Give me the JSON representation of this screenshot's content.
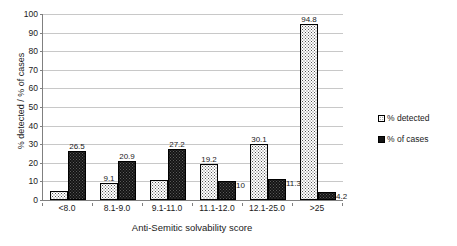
{
  "chart_data": {
    "type": "bar",
    "title": "",
    "subtitle": "",
    "xlabel": "Anti-Semitic solvability score",
    "ylabel": "% detected / % of cases",
    "ylim": [
      0,
      100
    ],
    "ytick_step": 10,
    "yticks": [
      "100",
      "90",
      "80",
      "70",
      "60",
      "50",
      "40",
      "30",
      "20",
      "10",
      "0"
    ],
    "grid": true,
    "legend_position": "right",
    "categories": [
      "<8.0",
      "8.1-9.0",
      "9.1-11.0",
      "11.1-12.0",
      "12.1-25.0",
      ">25"
    ],
    "series": [
      {
        "name": "% detected",
        "values": [
          4.8,
          9.1,
          10.5,
          19.2,
          30.1,
          94.8
        ],
        "labels": [
          "4.8",
          "9.1",
          "10.5",
          "19.2",
          "30.1",
          "94.8"
        ],
        "label_position": [
          "side",
          "top",
          "side",
          "top",
          "top",
          "top"
        ],
        "pattern": "light-dotted",
        "fill": "#ffffff",
        "border": "#000000"
      },
      {
        "name": "% of cases",
        "values": [
          26.5,
          20.9,
          27.2,
          10.0,
          11.3,
          4.2
        ],
        "labels": [
          "26.5",
          "20.9",
          "27.2",
          "10",
          "11.3",
          "4.2"
        ],
        "label_position": [
          "top",
          "top",
          "top",
          "side",
          "side",
          "side"
        ],
        "pattern": "dark-dotted",
        "fill": "#141414",
        "border": "#000000"
      }
    ]
  },
  "legend": {
    "items": [
      {
        "label": "% detected",
        "style": "detected"
      },
      {
        "label": "% of cases",
        "style": "cases"
      }
    ]
  },
  "colors": {
    "gridline": "#c8c8c8",
    "axis": "#808080",
    "text": "#1a1a1a",
    "detected_fill": "#ffffff",
    "cases_fill": "#141414"
  }
}
